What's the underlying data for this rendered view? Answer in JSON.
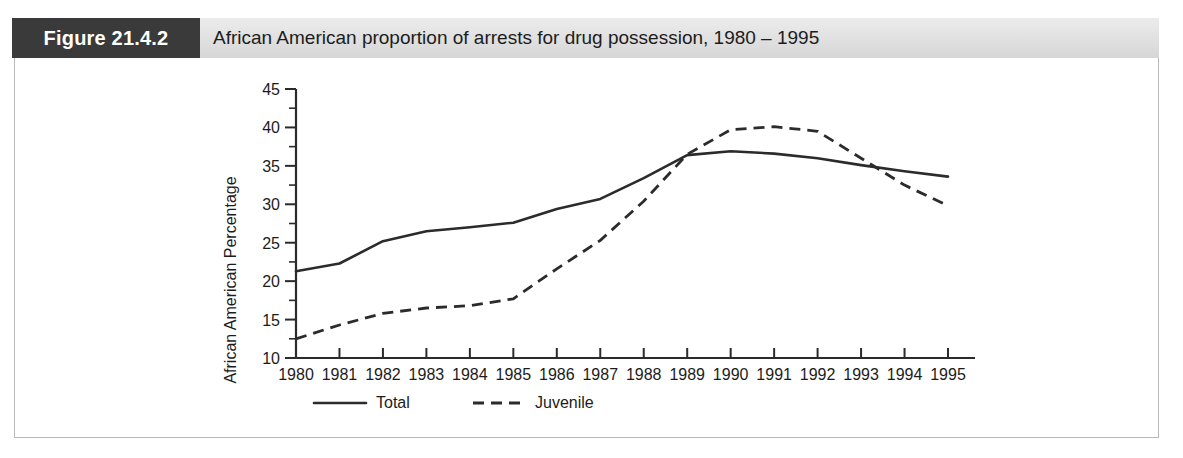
{
  "figure": {
    "label": "Figure 21.4.2",
    "title": "African American proportion of arrests for drug possession, 1980 – 1995",
    "label_bg": "#3a3a3a",
    "header_bg": "#e4e4e4",
    "border_color": "#b9b9b9"
  },
  "chart_data": {
    "type": "line",
    "title": "African American proportion of arrests for drug possession, 1980 – 1995",
    "xlabel": "",
    "ylabel": "African American Percentage",
    "x": [
      1980,
      1981,
      1982,
      1983,
      1984,
      1985,
      1986,
      1987,
      1988,
      1989,
      1990,
      1991,
      1992,
      1993,
      1994,
      1995
    ],
    "categories": [
      "1980",
      "1981",
      "1982",
      "1983",
      "1984",
      "1985",
      "1986",
      "1987",
      "1988",
      "1989",
      "1990",
      "1991",
      "1992",
      "1993",
      "1994",
      "1995"
    ],
    "series": [
      {
        "name": "Total",
        "style": "solid",
        "color": "#2b2b2b",
        "values": [
          21.3,
          22.3,
          25.2,
          26.5,
          27.0,
          27.6,
          29.4,
          30.7,
          33.4,
          36.4,
          36.9,
          36.6,
          36.0,
          35.1,
          34.3,
          33.6
        ]
      },
      {
        "name": "Juvenile",
        "style": "dashed",
        "color": "#2b2b2b",
        "values": [
          12.5,
          14.3,
          15.8,
          16.5,
          16.8,
          17.7,
          21.6,
          25.3,
          30.4,
          36.5,
          39.7,
          40.1,
          39.5,
          36.0,
          32.5,
          29.8
        ]
      }
    ],
    "ylim": [
      10,
      45
    ],
    "ytick_step": 5,
    "yticks": [
      10,
      15,
      20,
      25,
      30,
      35,
      40,
      45
    ],
    "ytick_labels": [
      "10",
      "15",
      "20",
      "25",
      "30",
      "35",
      "40",
      "45"
    ],
    "yminor_step": 2.5,
    "xlim": [
      1980,
      1995
    ],
    "grid": false,
    "legend_position": "bottom",
    "legend": [
      "Total",
      "Juvenile"
    ]
  }
}
